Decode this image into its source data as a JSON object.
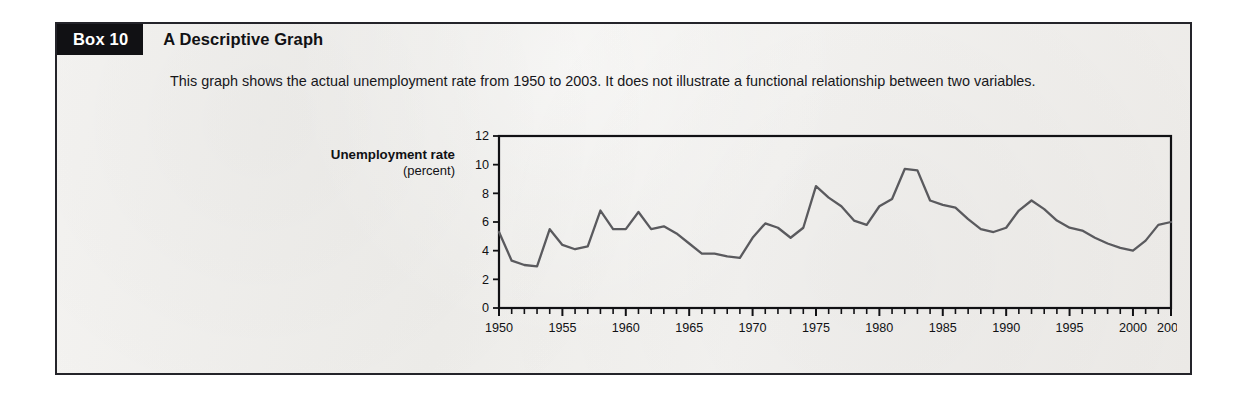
{
  "box": {
    "tag": "Box 10",
    "title": "A Descriptive Graph",
    "description": "This graph shows the actual unemployment rate from 1950 to 2003. It does not illustrate a functional relationship between two variables.",
    "border_color": "#24242a",
    "tag_background": "#111114",
    "tag_text_color": "#ffffff",
    "background": "#f3f2f0"
  },
  "chart_data": {
    "type": "line",
    "title": "",
    "subtitle": "",
    "xlabel": "",
    "ylabel": "Unemployment rate",
    "ylabel_unit": "(percent)",
    "ylim": [
      0,
      12
    ],
    "xlim": [
      1950,
      2003
    ],
    "grid": false,
    "legend": "none",
    "line_color": "#5a5a5e",
    "axis_color": "#111114",
    "y_ticks": [
      0,
      2,
      4,
      6,
      8,
      10,
      12
    ],
    "x_ticks": [
      1950,
      1955,
      1960,
      1965,
      1970,
      1975,
      1980,
      1985,
      1990,
      1995,
      2000,
      2003
    ],
    "x_minor_tick_interval": 1,
    "series": [
      {
        "name": "Unemployment rate",
        "x": [
          1950,
          1951,
          1952,
          1953,
          1954,
          1955,
          1956,
          1957,
          1958,
          1959,
          1960,
          1961,
          1962,
          1963,
          1964,
          1965,
          1966,
          1967,
          1968,
          1969,
          1970,
          1971,
          1972,
          1973,
          1974,
          1975,
          1976,
          1977,
          1978,
          1979,
          1980,
          1981,
          1982,
          1983,
          1984,
          1985,
          1986,
          1987,
          1988,
          1989,
          1990,
          1991,
          1992,
          1993,
          1994,
          1995,
          1996,
          1997,
          1998,
          1999,
          2000,
          2001,
          2002,
          2003
        ],
        "values": [
          5.3,
          3.3,
          3.0,
          2.9,
          5.5,
          4.4,
          4.1,
          4.3,
          6.8,
          5.5,
          5.5,
          6.7,
          5.5,
          5.7,
          5.2,
          4.5,
          3.8,
          3.8,
          3.6,
          3.5,
          4.9,
          5.9,
          5.6,
          4.9,
          5.6,
          8.5,
          7.7,
          7.1,
          6.1,
          5.8,
          7.1,
          7.6,
          9.7,
          9.6,
          7.5,
          7.2,
          7.0,
          6.2,
          5.5,
          5.3,
          5.6,
          6.8,
          7.5,
          6.9,
          6.1,
          5.6,
          5.4,
          4.9,
          4.5,
          4.2,
          4.0,
          4.7,
          5.8,
          6.0
        ]
      }
    ]
  }
}
